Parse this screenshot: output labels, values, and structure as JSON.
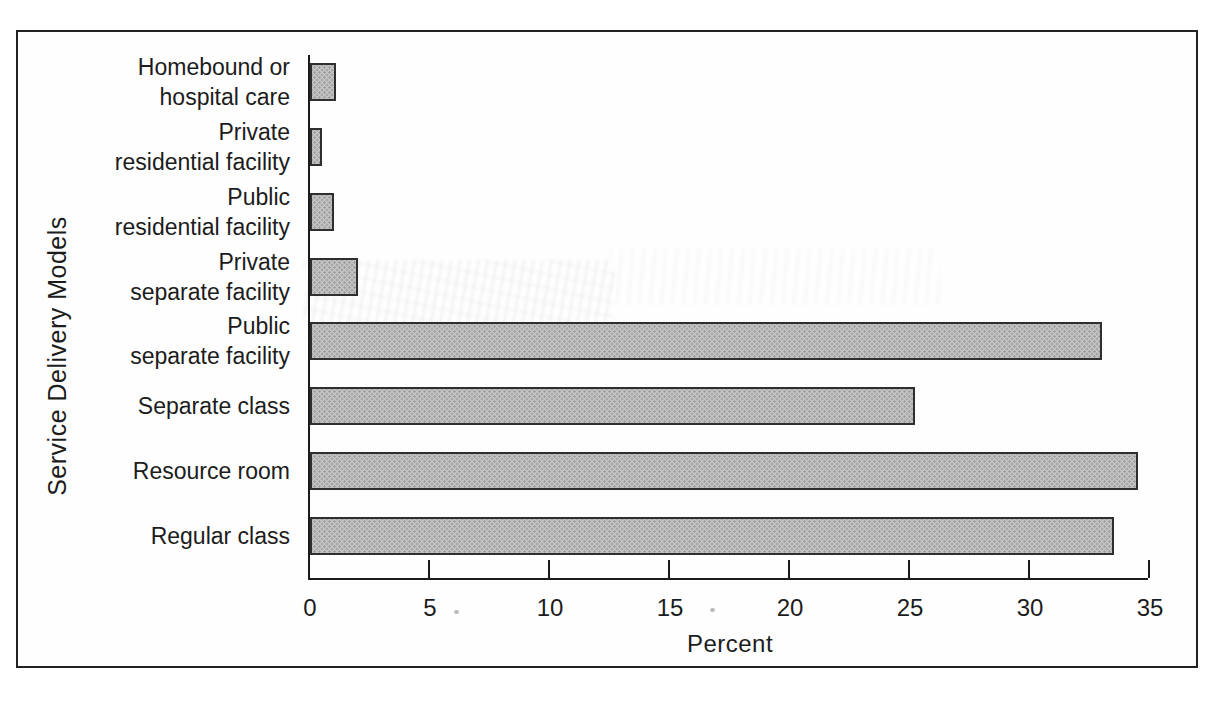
{
  "chart_data": {
    "type": "bar",
    "orientation": "horizontal",
    "title": "",
    "xlabel": "Percent",
    "ylabel": "Service Delivery Models",
    "xlim": [
      0,
      35
    ],
    "xticks": [
      0,
      5,
      10,
      15,
      20,
      25,
      30,
      35
    ],
    "grid": false,
    "legend": false,
    "categories": [
      "Homebound or hospital care",
      "Private residential facility",
      "Public residential facility",
      "Private separate facility",
      "Public separate facility",
      "Separate class",
      "Resource room",
      "Regular class"
    ],
    "category_lines": [
      [
        "Homebound or",
        "hospital care"
      ],
      [
        "Private",
        "residential facility"
      ],
      [
        "Public",
        "residential facility"
      ],
      [
        "Private",
        "separate facility"
      ],
      [
        "Public",
        "separate facility"
      ],
      [
        "Separate class"
      ],
      [
        "Resource room"
      ],
      [
        "Regular class"
      ]
    ],
    "values": [
      1.1,
      0.5,
      1.0,
      2.0,
      33.0,
      25.2,
      34.5,
      33.5
    ],
    "unit": "percent"
  },
  "style": {
    "bar_fill": "#c6c6c6",
    "bar_dot": "#9f9f9f",
    "bar_border": "#2f2f2f",
    "axis_color": "#1b1b1b",
    "text_color": "#1c1c1c",
    "frame_border": "#222222",
    "page_background": "#ffffff"
  }
}
